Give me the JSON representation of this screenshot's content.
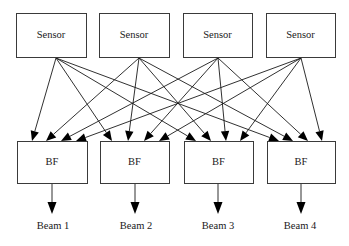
{
  "diagram": {
    "title": "",
    "sensors": [
      {
        "label": "Sensor",
        "x": 16,
        "y": 13,
        "w": 70,
        "h": 44,
        "out_x": 56
      },
      {
        "label": "Sensor",
        "x": 99,
        "y": 13,
        "w": 70,
        "h": 44,
        "out_x": 139
      },
      {
        "label": "Sensor",
        "x": 183,
        "y": 13,
        "w": 69,
        "h": 44,
        "out_x": 218
      },
      {
        "label": "Sensor",
        "x": 266,
        "y": 13,
        "w": 69,
        "h": 44,
        "out_x": 301
      }
    ],
    "beamformers": [
      {
        "label": "BF",
        "x": 17,
        "y": 141,
        "w": 70,
        "h": 42,
        "in_x": [
          32,
          46,
          61,
          76
        ],
        "out_x": 52
      },
      {
        "label": "BF",
        "x": 100,
        "y": 141,
        "w": 69,
        "h": 42,
        "in_x": [
          112,
          128,
          144,
          159
        ],
        "out_x": 135
      },
      {
        "label": "BF",
        "x": 184,
        "y": 141,
        "w": 69,
        "h": 42,
        "in_x": [
          196,
          211,
          226,
          240
        ],
        "out_x": 218
      },
      {
        "label": "BF",
        "x": 267,
        "y": 141,
        "w": 68,
        "h": 42,
        "in_x": [
          279,
          293,
          308,
          322
        ],
        "out_x": 301
      }
    ],
    "outputs": [
      {
        "label": "Beam 1",
        "x": 53,
        "y": 227
      },
      {
        "label": "Beam 2",
        "x": 136,
        "y": 227
      },
      {
        "label": "Beam 3",
        "x": 218,
        "y": 227
      },
      {
        "label": "Beam 4",
        "x": 300,
        "y": 227
      }
    ],
    "connections": "every sensor k connects to slot k on every beamformer (fully connected 4x4)",
    "output_arrow_end_y": 214,
    "colors": {
      "stroke": "#1a1a1a",
      "box_border": "#3a3a3a",
      "background": "#ffffff"
    }
  }
}
